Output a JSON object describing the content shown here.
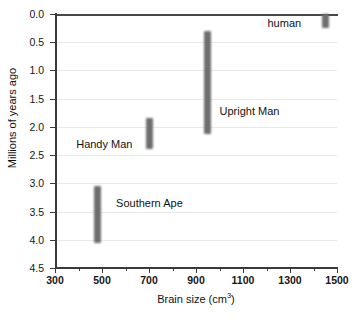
{
  "chart_data": {
    "type": "bar",
    "orientation": "range-bars",
    "title": "",
    "xlabel": "Brain size (cm3)",
    "xlabel_text": "Brain size (cm",
    "xlabel_sup": "3",
    "xlabel_tail": ")",
    "ylabel": "Millions of years ago",
    "xlim": [
      300,
      1500
    ],
    "ylim": [
      0.0,
      4.5
    ],
    "y_inverted": true,
    "grid": true,
    "grid_axis": "y",
    "legend": "none",
    "xticks": [
      300,
      500,
      700,
      900,
      1100,
      1300,
      1500
    ],
    "xtick_labels": [
      "300",
      "500",
      "700",
      "900",
      "1100",
      "1300",
      "1500"
    ],
    "x_minor_ticks": [
      400,
      600,
      800,
      1000,
      1200,
      1400
    ],
    "yticks": [
      0.0,
      0.5,
      1.0,
      1.5,
      2.0,
      2.5,
      3.0,
      3.5,
      4.0,
      4.5
    ],
    "ytick_labels": [
      "0.0",
      "0.5",
      "1.0",
      "1.5",
      "2.0",
      "2.5",
      "3.0",
      "3.5",
      "4.0",
      "4.5"
    ],
    "bar_color": "#6e6e6e",
    "grid_color": "#e9e9e9",
    "axis_color": "#3a3a3a",
    "series": [
      {
        "name": "Southern Ape",
        "label": "Southern Ape",
        "brain_size": 480,
        "time_start": 4.05,
        "time_end": 3.05,
        "label_x": 560,
        "label_y": 3.35
      },
      {
        "name": "Handy Man",
        "label": "Handy Man",
        "brain_size": 700,
        "time_start": 2.4,
        "time_end": 1.85,
        "label_x": 390,
        "label_y": 2.3
      },
      {
        "name": "Upright Man",
        "label": "Upright Man",
        "brain_size": 950,
        "time_start": 2.12,
        "time_end": 0.3,
        "label_x": 1000,
        "label_y": 1.72
      },
      {
        "name": "human",
        "label": "human",
        "brain_size": 1450,
        "time_start": 0.25,
        "time_end": 0.0,
        "label_x": 1400,
        "label_y": 0.16
      }
    ]
  }
}
